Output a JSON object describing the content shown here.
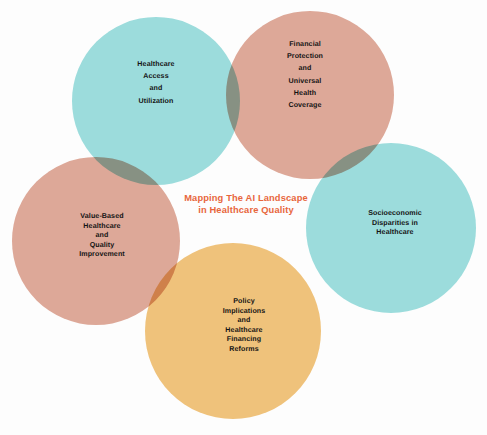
{
  "diagram": {
    "type": "venn",
    "title": "Mapping The AI Landscape\nin Healthcare Quality",
    "title_color": "#e8663c",
    "background": "#fdfdfd",
    "sets": [
      {
        "id": "healthcare-access",
        "label": "Healthcare\nAccess\nand\nUtilization",
        "color": "#9cdcdc",
        "position": "top-left"
      },
      {
        "id": "financial-protection",
        "label": "Financial\nProtection\nand\nUniversal\nHealth\nCoverage",
        "color": "#dda898",
        "position": "top-right"
      },
      {
        "id": "value-based-healthcare",
        "label": "Value-Based\nHealthcare\nand\nQuality\nImprovement",
        "color": "#dda898",
        "position": "left"
      },
      {
        "id": "socioeconomic-disparities",
        "label": "Socioeconomic\nDisparities in\nHealthcare",
        "color": "#9cdcdc",
        "position": "right"
      },
      {
        "id": "policy-implications",
        "label": "Policy\nImplications\nand\nHealthcare\nFinancing\nReforms",
        "color": "#efc27b",
        "position": "bottom"
      }
    ]
  }
}
